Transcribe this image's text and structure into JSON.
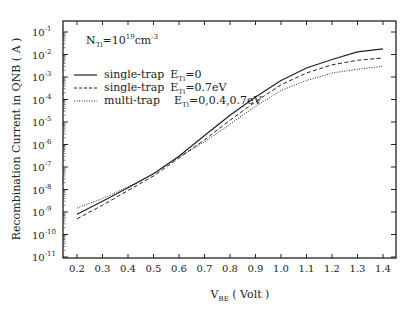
{
  "chart_data": {
    "type": "line",
    "title": "",
    "annotation": {
      "base": "N",
      "sub": "Ti",
      "text": "=10",
      "exp": "19",
      "unit": "cm",
      "unit_exp": "-3"
    },
    "xlabel": {
      "base": "V",
      "sub": "BE",
      "rest": " ( Volt )"
    },
    "ylabel": "Recombination Current in QNB ( A )",
    "xlim": [
      0.2,
      1.4
    ],
    "ylim": [
      1e-11,
      0.1
    ],
    "yscale": "log",
    "grid": false,
    "legend_position": "upper-left",
    "x_ticks": [
      "0.2",
      "0.3",
      "0.4",
      "0.5",
      "0.6",
      "0.7",
      "0.8",
      "0.9",
      "1.0",
      "1.1",
      "1.2",
      "1.3",
      "1.4"
    ],
    "y_ticks": [
      {
        "exp": "-1"
      },
      {
        "exp": "-2"
      },
      {
        "exp": "-3"
      },
      {
        "exp": "-4"
      },
      {
        "exp": "-5"
      },
      {
        "exp": "-6"
      },
      {
        "exp": "-7"
      },
      {
        "exp": "-8"
      },
      {
        "exp": "-9"
      },
      {
        "exp": "-10"
      },
      {
        "exp": "-11"
      }
    ],
    "x": [
      0.2,
      0.3,
      0.4,
      0.5,
      0.6,
      0.7,
      0.8,
      0.9,
      1.0,
      1.1,
      1.2,
      1.3,
      1.4
    ],
    "series": [
      {
        "name": "single-trap E_Ti=0",
        "label": "single-trap",
        "e_label": "=0",
        "style": "solid",
        "values": [
          8e-10,
          3e-09,
          1.2e-08,
          5e-08,
          3e-07,
          2.5e-06,
          2e-05,
          0.00013,
          0.0007,
          0.0025,
          0.006,
          0.013,
          0.018
        ]
      },
      {
        "name": "single-trap E_Ti=0.7eV",
        "label": "single-trap",
        "e_label": "=0.7eV",
        "style": "dashed",
        "values": [
          5e-10,
          2e-09,
          9e-09,
          4e-08,
          2.5e-07,
          1.6e-06,
          1.2e-05,
          8e-05,
          0.00045,
          0.0015,
          0.0035,
          0.0055,
          0.007
        ]
      },
      {
        "name": "multi-trap E_Ti=0,0.4,0.7eV",
        "label": "multi-trap",
        "e_label": "=0,0.4,0.7eV",
        "style": "dotted",
        "values": [
          1.5e-09,
          4e-09,
          1.3e-08,
          5e-08,
          2.8e-07,
          1.3e-06,
          8e-06,
          5e-05,
          0.00025,
          0.0007,
          0.0015,
          0.0022,
          0.003
        ]
      }
    ]
  }
}
